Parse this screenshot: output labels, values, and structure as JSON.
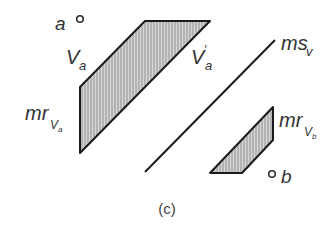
{
  "figure": {
    "caption": "(c)",
    "colors": {
      "stroke": "#1a1a1a",
      "fill": "#b8b8b8",
      "text": "#333333"
    },
    "points": [
      {
        "id": "a",
        "label": "a"
      },
      {
        "id": "b",
        "label": "b"
      }
    ],
    "labels": {
      "va": {
        "main": "V",
        "sub": "a"
      },
      "va_prime": {
        "main": "V",
        "prime": "′",
        "sub": "a"
      },
      "ms_v": {
        "main": "ms",
        "sub": "v"
      },
      "mr_va": {
        "main": "mr",
        "sub": "V",
        "subsub": "a"
      },
      "mr_vb": {
        "main": "mr",
        "sub": "V",
        "subsub": "b"
      }
    }
  }
}
